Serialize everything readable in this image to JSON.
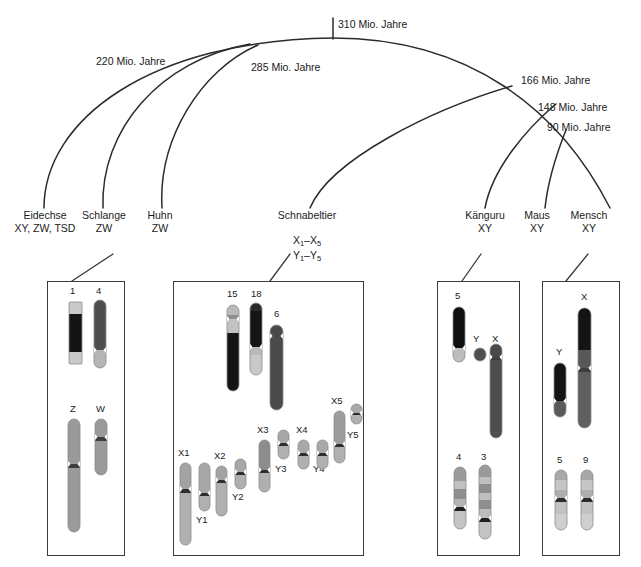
{
  "figure": {
    "type": "phylogenetic-tree-with-karyotypes",
    "language": "de"
  },
  "tree": {
    "time_labels": [
      {
        "id": "t310",
        "text": "310 Mio. Jahre",
        "x": 338,
        "y": 18
      },
      {
        "id": "t220",
        "text": "220 Mio. Jahre",
        "x": 96,
        "y": 55
      },
      {
        "id": "t285",
        "text": "285 Mio. Jahre",
        "x": 251,
        "y": 61
      },
      {
        "id": "t166",
        "text": "166 Mio. Jahre",
        "x": 521,
        "y": 74
      },
      {
        "id": "t148",
        "text": "148 Mio. Jahre",
        "x": 538,
        "y": 101
      },
      {
        "id": "t90",
        "text": "90 Mio. Jahre",
        "x": 547,
        "y": 121
      }
    ]
  },
  "species": [
    {
      "id": "eidechse",
      "name": "Eidechse",
      "sex_system": "XY, ZW, TSD",
      "x": 8,
      "y": 209,
      "width": 74
    },
    {
      "id": "schlange",
      "name": "Schlange",
      "sex_system": "ZW",
      "x": 74,
      "y": 209,
      "width": 60
    },
    {
      "id": "huhn",
      "name": "Huhn",
      "sex_system": "ZW",
      "x": 135,
      "y": 209,
      "width": 50
    },
    {
      "id": "schnabeltier",
      "name": "Schnabeltier",
      "sex_system": "",
      "x": 260,
      "y": 209,
      "width": 94
    },
    {
      "id": "kaenguru",
      "name": "Känguru",
      "sex_system": "XY",
      "x": 456,
      "y": 209,
      "width": 58
    },
    {
      "id": "maus",
      "name": "Maus",
      "sex_system": "XY",
      "x": 515,
      "y": 209,
      "width": 44
    },
    {
      "id": "mensch",
      "name": "Mensch",
      "sex_system": "XY",
      "x": 561,
      "y": 209,
      "width": 56
    }
  ],
  "platypus_sex_chromosomes": {
    "line1_prefix": "X",
    "line1_sub1": "1",
    "line1_dash": "–",
    "line1_base2": "X",
    "line1_sub2": "5",
    "line2_prefix": "Y",
    "line2_sub1": "1",
    "line2_dash": "–",
    "line2_base2": "Y",
    "line2_sub2": "5"
  },
  "karyotype_boxes": [
    {
      "id": "box-huhn",
      "x": 47,
      "y": 281,
      "width": 78,
      "height": 275,
      "chromosomes": [
        {
          "label": "1",
          "lx": 70,
          "ly": 286,
          "x": 69,
          "y": 302,
          "w": 13,
          "h": 62,
          "shape": "rect",
          "bands": [
            {
              "c": "#c9c9c9",
              "h": 12
            },
            {
              "c": "#141414",
              "h": 38
            },
            {
              "c": "#c9c9c9",
              "h": 12
            }
          ]
        },
        {
          "label": "4",
          "lx": 96,
          "ly": 286,
          "x": 94,
          "y": 300,
          "w": 12,
          "h": 68,
          "shape": "round",
          "bands": [
            {
              "c": "#4e4e4e",
              "h": 50
            },
            {
              "c": "#b5b5b5",
              "h": 18
            }
          ],
          "pinch": 50
        },
        {
          "label": "Z",
          "lx": 70,
          "ly": 404,
          "x": 68,
          "y": 419,
          "w": 12,
          "h": 113,
          "shape": "round",
          "bands": [
            {
              "c": "#9a9a9a",
              "h": 45
            },
            {
              "c": "#3d3d3d",
              "h": 4
            },
            {
              "c": "#9a9a9a",
              "h": 64
            }
          ],
          "pinch": 45
        },
        {
          "label": "W",
          "lx": 96,
          "ly": 404,
          "x": 95,
          "y": 419,
          "w": 12,
          "h": 56,
          "shape": "round",
          "bands": [
            {
              "c": "#9a9a9a",
              "h": 18
            },
            {
              "c": "#3d3d3d",
              "h": 4
            },
            {
              "c": "#9a9a9a",
              "h": 34
            }
          ],
          "pinch": 18
        }
      ]
    },
    {
      "id": "box-schnabeltier",
      "x": 173,
      "y": 281,
      "width": 191,
      "height": 275,
      "chromosomes": [
        {
          "label": "15",
          "lx": 227,
          "ly": 289,
          "x": 227,
          "y": 305,
          "w": 12,
          "h": 86,
          "shape": "round",
          "bands": [
            {
              "c": "#b9b9b9",
              "h": 10
            },
            {
              "c": "#8e8e8e",
              "h": 4
            },
            {
              "c": "#c2c2c2",
              "h": 14
            },
            {
              "c": "#141414",
              "h": 58
            }
          ],
          "pinch": 14
        },
        {
          "label": "18",
          "lx": 251,
          "ly": 289,
          "x": 250,
          "y": 303,
          "w": 12,
          "h": 72,
          "shape": "round",
          "bands": [
            {
              "c": "#2b2b2b",
              "h": 8
            },
            {
              "c": "#141414",
              "h": 36
            },
            {
              "c": "#b9b9b9",
              "h": 8
            },
            {
              "c": "#c9c9c9",
              "h": 20
            }
          ],
          "pinch": 44
        },
        {
          "label": "6",
          "lx": 274,
          "ly": 309,
          "x": 270,
          "y": 325,
          "w": 13,
          "h": 85,
          "shape": "round",
          "bands": [
            {
              "c": "#4a4a4a",
              "h": 85
            }
          ],
          "pinch": 11
        },
        {
          "label": "X1",
          "lx": 178,
          "ly": 448,
          "x": 180,
          "y": 463,
          "w": 11,
          "h": 82,
          "shape": "round",
          "bands": [
            {
              "c": "#a3a3a3",
              "h": 26
            },
            {
              "c": "#2e2e2e",
              "h": 4
            },
            {
              "c": "#b0b0b0",
              "h": 52
            }
          ],
          "pinch": 26
        },
        {
          "label": "Y1",
          "lx": 196,
          "ly": 515,
          "x": 199,
          "y": 463,
          "w": 11,
          "h": 48,
          "shape": "round",
          "bands": [
            {
              "c": "#a8a8a8",
              "h": 30
            },
            {
              "c": "#2e2e2e",
              "h": 3
            },
            {
              "c": "#b0b0b0",
              "h": 15
            }
          ],
          "pinch": 30
        },
        {
          "label": "X2",
          "lx": 214,
          "ly": 451,
          "x": 216,
          "y": 466,
          "w": 11,
          "h": 50,
          "shape": "round",
          "bands": [
            {
              "c": "#a3a3a3",
              "h": 14
            },
            {
              "c": "#2e2e2e",
              "h": 3
            },
            {
              "c": "#b0b0b0",
              "h": 33
            }
          ],
          "pinch": 14
        },
        {
          "label": "Y2",
          "lx": 232,
          "ly": 492,
          "x": 235,
          "y": 459,
          "w": 11,
          "h": 30,
          "shape": "round",
          "bands": [
            {
              "c": "#a8a8a8",
              "h": 13
            },
            {
              "c": "#2e2e2e",
              "h": 3
            },
            {
              "c": "#b0b0b0",
              "h": 14
            }
          ],
          "pinch": 13
        },
        {
          "label": "X3",
          "lx": 257,
          "ly": 425,
          "x": 259,
          "y": 440,
          "w": 11,
          "h": 52,
          "shape": "round",
          "bands": [
            {
              "c": "#8d8d8d",
              "h": 30
            },
            {
              "c": "#2e2e2e",
              "h": 3
            },
            {
              "c": "#b0b0b0",
              "h": 19
            }
          ],
          "pinch": 30
        },
        {
          "label": "Y3",
          "lx": 275,
          "ly": 464,
          "x": 278,
          "y": 430,
          "w": 11,
          "h": 29,
          "shape": "round",
          "bands": [
            {
              "c": "#a8a8a8",
              "h": 13
            },
            {
              "c": "#2e2e2e",
              "h": 3
            },
            {
              "c": "#b0b0b0",
              "h": 13
            }
          ],
          "pinch": 13
        },
        {
          "label": "X4",
          "lx": 296,
          "ly": 425,
          "x": 298,
          "y": 440,
          "w": 11,
          "h": 29,
          "shape": "round",
          "bands": [
            {
              "c": "#a8a8a8",
              "h": 13
            },
            {
              "c": "#2e2e2e",
              "h": 3
            },
            {
              "c": "#b0b0b0",
              "h": 13
            }
          ],
          "pinch": 13
        },
        {
          "label": "Y4",
          "lx": 313,
          "ly": 464,
          "x": 317,
          "y": 440,
          "w": 11,
          "h": 29,
          "shape": "round",
          "bands": [
            {
              "c": "#a8a8a8",
              "h": 13
            },
            {
              "c": "#2e2e2e",
              "h": 3
            },
            {
              "c": "#b0b0b0",
              "h": 13
            }
          ],
          "pinch": 13
        },
        {
          "label": "X5",
          "lx": 331,
          "ly": 396,
          "x": 334,
          "y": 411,
          "w": 11,
          "h": 52,
          "shape": "round",
          "bands": [
            {
              "c": "#9d9d9d",
              "h": 33
            },
            {
              "c": "#2e2e2e",
              "h": 3
            },
            {
              "c": "#b0b0b0",
              "h": 16
            }
          ],
          "pinch": 33
        },
        {
          "label": "Y5",
          "lx": 347,
          "ly": 430,
          "x": 351,
          "y": 404,
          "w": 11,
          "h": 20,
          "shape": "round",
          "bands": [
            {
              "c": "#a8a8a8",
              "h": 9
            },
            {
              "c": "#2e2e2e",
              "h": 2
            },
            {
              "c": "#b0b0b0",
              "h": 9
            }
          ],
          "pinch": 9
        }
      ]
    },
    {
      "id": "box-kaenguru",
      "x": 437,
      "y": 281,
      "width": 83,
      "height": 275,
      "chromosomes": [
        {
          "label": "5",
          "lx": 455,
          "ly": 291,
          "x": 453,
          "y": 307,
          "w": 12,
          "h": 55,
          "shape": "round",
          "bands": [
            {
              "c": "#0f0f0f",
              "h": 41
            },
            {
              "c": "#bdbdbd",
              "h": 14
            }
          ],
          "pinch": 41
        },
        {
          "label": "Y",
          "lx": 473,
          "ly": 334,
          "x": 474,
          "y": 348,
          "w": 12,
          "h": 13,
          "shape": "round",
          "bands": [
            {
              "c": "#4e4e4e",
              "h": 13
            }
          ],
          "pinch": 0
        },
        {
          "label": "X",
          "lx": 492,
          "ly": 334,
          "x": 490,
          "y": 344,
          "w": 12,
          "h": 94,
          "shape": "round",
          "bands": [
            {
              "c": "#4a4a4a",
              "h": 13
            },
            {
              "c": "#3f3f3f",
              "h": 3
            },
            {
              "c": "#4e4e4e",
              "h": 78
            }
          ],
          "pinch": 13
        },
        {
          "label": "4",
          "lx": 456,
          "ly": 452,
          "x": 454,
          "y": 467,
          "w": 12,
          "h": 62,
          "shape": "round",
          "bands": [
            {
              "c": "#9a9a9a",
              "h": 14
            },
            {
              "c": "#c0c0c0",
              "h": 8
            },
            {
              "c": "#8e8e8e",
              "h": 10
            },
            {
              "c": "#b5b5b5",
              "h": 8
            },
            {
              "c": "#1f1f1f",
              "h": 4
            },
            {
              "c": "#c4c4c4",
              "h": 18
            }
          ],
          "pinch": 40
        },
        {
          "label": "3",
          "lx": 481,
          "ly": 452,
          "x": 479,
          "y": 465,
          "w": 12,
          "h": 74,
          "shape": "round",
          "bands": [
            {
              "c": "#9a9a9a",
              "h": 12
            },
            {
              "c": "#c0c0c0",
              "h": 7
            },
            {
              "c": "#8e8e8e",
              "h": 9
            },
            {
              "c": "#bfbfbf",
              "h": 7
            },
            {
              "c": "#8e8e8e",
              "h": 9
            },
            {
              "c": "#bcbcbc",
              "h": 9
            },
            {
              "c": "#1f1f1f",
              "h": 4
            },
            {
              "c": "#c4c4c4",
              "h": 17
            }
          ],
          "pinch": 53
        }
      ]
    },
    {
      "id": "box-mensch",
      "x": 542,
      "y": 281,
      "width": 78,
      "height": 275,
      "chromosomes": [
        {
          "label": "X",
          "lx": 581,
          "ly": 292,
          "x": 578,
          "y": 308,
          "w": 13,
          "h": 120,
          "shape": "round",
          "bands": [
            {
              "c": "#141414",
              "h": 42
            },
            {
              "c": "#585858",
              "h": 18
            },
            {
              "c": "#3d3d3d",
              "h": 4
            },
            {
              "c": "#5f5f5f",
              "h": 56
            }
          ],
          "pinch": 60
        },
        {
          "label": "Y",
          "lx": 556,
          "ly": 347,
          "x": 554,
          "y": 363,
          "w": 12,
          "h": 54,
          "shape": "round",
          "bands": [
            {
              "c": "#141414",
              "h": 38
            },
            {
              "c": "#5a5a5a",
              "h": 16
            }
          ],
          "pinch": 38
        },
        {
          "label": "5",
          "lx": 557,
          "ly": 455,
          "x": 555,
          "y": 470,
          "w": 12,
          "h": 60,
          "shape": "round",
          "bands": [
            {
              "c": "#a8a8a8",
              "h": 10
            },
            {
              "c": "#c6c6c6",
              "h": 10
            },
            {
              "c": "#aeaeae",
              "h": 8
            },
            {
              "c": "#2b2b2b",
              "h": 4
            },
            {
              "c": "#c2c2c2",
              "h": 12
            },
            {
              "c": "#cfcfcf",
              "h": 16
            }
          ],
          "pinch": 28
        },
        {
          "label": "9",
          "lx": 583,
          "ly": 455,
          "x": 581,
          "y": 470,
          "w": 12,
          "h": 60,
          "shape": "round",
          "bands": [
            {
              "c": "#a8a8a8",
              "h": 10
            },
            {
              "c": "#c6c6c6",
              "h": 10
            },
            {
              "c": "#aeaeae",
              "h": 8
            },
            {
              "c": "#2b2b2b",
              "h": 4
            },
            {
              "c": "#c2c2c2",
              "h": 12
            },
            {
              "c": "#cfcfcf",
              "h": 16
            }
          ],
          "pinch": 28
        }
      ]
    }
  ]
}
